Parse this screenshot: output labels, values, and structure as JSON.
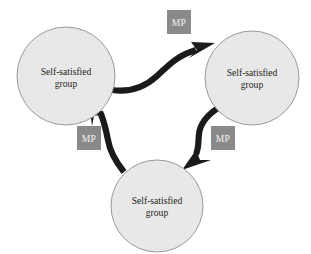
{
  "diagram": {
    "type": "cycle-diagram",
    "background_color": "#ffffff",
    "node_fill_color": "#e8e8e8",
    "node_stroke_color": "#9a9a9a",
    "arrow_color": "#1a1a1a",
    "badge_fill_color": "#8a8a8a",
    "badge_text_color": "#f2f2f2",
    "node_text_color": "#231f20",
    "nodes": [
      {
        "id": "node-left",
        "name": "self-satisfied-group-left",
        "line1": "Self-satisfied",
        "line2": "group",
        "cx": 66,
        "cy": 76,
        "r": 49
      },
      {
        "id": "node-right",
        "name": "self-satisfied-group-right",
        "line1": "Self-satisfied",
        "line2": "group",
        "cx": 252,
        "cy": 78,
        "r": 47
      },
      {
        "id": "node-bottom",
        "name": "self-satisfied-group-bottom",
        "line1": "Self-satisfied",
        "line2": "group",
        "cx": 157,
        "cy": 206,
        "r": 46
      }
    ],
    "badges": [
      {
        "id": "badge-top",
        "name": "mp-badge-top",
        "label": "MP",
        "x": 167,
        "y": 10,
        "w": 24,
        "h": 24
      },
      {
        "id": "badge-left",
        "name": "mp-badge-left",
        "label": "MP",
        "x": 77,
        "y": 126,
        "w": 24,
        "h": 24
      },
      {
        "id": "badge-right",
        "name": "mp-badge-right",
        "label": "MP",
        "x": 211,
        "y": 126,
        "w": 24,
        "h": 24
      }
    ],
    "arrows": [
      {
        "id": "arrow-left-to-right",
        "name": "arrow-left-to-right",
        "from": "node-left",
        "to": "node-right",
        "label": "MP"
      },
      {
        "id": "arrow-right-to-bottom",
        "name": "arrow-right-to-bottom",
        "from": "node-right",
        "to": "node-bottom",
        "label": "MP"
      },
      {
        "id": "arrow-bottom-to-left",
        "name": "arrow-bottom-to-left",
        "from": "node-bottom",
        "to": "node-left",
        "label": "MP"
      }
    ]
  }
}
